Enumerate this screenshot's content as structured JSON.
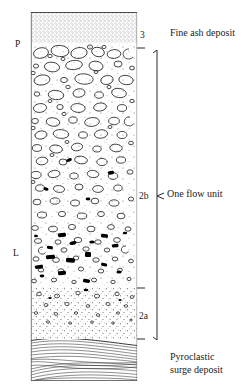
{
  "figure": {
    "type": "stratigraphic-column",
    "title": ""
  },
  "column": {
    "left_px": 31,
    "right_px": 137,
    "top_px": 12,
    "bottom_px": 381,
    "layers": [
      {
        "code": "3",
        "name": "fine-ash",
        "pattern": "fine stipple",
        "top_px": 12,
        "bottom_px": 43,
        "description": "Fine ash deposit"
      },
      {
        "code": "2b",
        "name": "pumice-rich-flow",
        "pattern": "large open pumice clasts in ash matrix",
        "top_px": 43,
        "bottom_px": 288,
        "description": "One flow unit"
      },
      {
        "code": "2a",
        "name": "basal-layer",
        "pattern": "fine stipple with small clasts",
        "top_px": 288,
        "bottom_px": 339,
        "description": "One flow unit"
      },
      {
        "code": "",
        "name": "surge-deposit",
        "pattern": "cross-laminated wavy bedding",
        "top_px": 339,
        "bottom_px": 381,
        "description": "Pyroclastic surge deposit"
      }
    ]
  },
  "unit_labels": [
    {
      "text": "3",
      "x": 140,
      "y": 30
    },
    {
      "text": "2b",
      "x": 139,
      "y": 191
    },
    {
      "text": "2a",
      "x": 139,
      "y": 311
    }
  ],
  "side_labels": [
    {
      "text": "P",
      "x": 15,
      "y": 39,
      "meaning": "pumice-concentration-zone"
    },
    {
      "text": "L",
      "x": 13,
      "y": 248,
      "meaning": "lithic-concentration-zone"
    }
  ],
  "descriptions": [
    {
      "text": "Fine ash deposit",
      "x": 170,
      "y": 28
    },
    {
      "text": "One flow unit",
      "x": 167,
      "y": 189
    }
  ],
  "description_multiline": {
    "line1": "Pyroclastic",
    "line2": "surge deposit",
    "x": 170,
    "y": 351
  },
  "bracket": {
    "x_px": 157,
    "top_px": 50,
    "bottom_px": 340,
    "tick_y_px": 196
  },
  "boundary_ticks": [
    {
      "y": 37
    },
    {
      "y": 48
    },
    {
      "y": 288
    },
    {
      "y": 339
    }
  ],
  "colors": {
    "ink": "#1a1a1a",
    "line": "#222222",
    "stipple": "#8a8a8a",
    "clast_fill": "#000000",
    "background": "#ffffff"
  }
}
